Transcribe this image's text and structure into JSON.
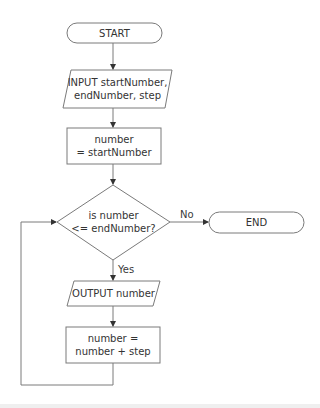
{
  "diagram": {
    "type": "flowchart",
    "colors": {
      "stroke": "#777777",
      "text": "#333333",
      "background": "#ffffff"
    },
    "nodes": [
      {
        "id": "start",
        "shape": "terminal",
        "lines": [
          "START"
        ]
      },
      {
        "id": "input",
        "shape": "parallelogram",
        "lines": [
          "INPUT startNumber,",
          "endNumber, step"
        ]
      },
      {
        "id": "init",
        "shape": "process",
        "lines": [
          "number",
          "= startNumber"
        ]
      },
      {
        "id": "decision",
        "shape": "diamond",
        "lines": [
          "is number",
          "<= endNumber?"
        ]
      },
      {
        "id": "end",
        "shape": "terminal",
        "lines": [
          "END"
        ]
      },
      {
        "id": "output",
        "shape": "parallelogram",
        "lines": [
          "OUTPUT number"
        ]
      },
      {
        "id": "increment",
        "shape": "process",
        "lines": [
          "number =",
          "number + step"
        ]
      }
    ],
    "edges": [
      {
        "from": "start",
        "to": "input",
        "label": ""
      },
      {
        "from": "input",
        "to": "init",
        "label": ""
      },
      {
        "from": "init",
        "to": "decision",
        "label": ""
      },
      {
        "from": "decision",
        "to": "end",
        "label": "No"
      },
      {
        "from": "decision",
        "to": "output",
        "label": "Yes"
      },
      {
        "from": "output",
        "to": "increment",
        "label": ""
      },
      {
        "from": "increment",
        "to": "decision",
        "label": ""
      }
    ]
  }
}
